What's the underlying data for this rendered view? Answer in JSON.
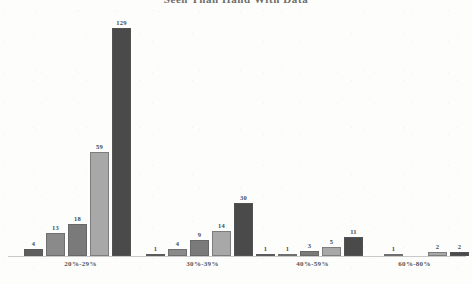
{
  "chart_data": {
    "type": "bar",
    "title": "Seen Than Hand With Data",
    "title_clipped": true,
    "categories": [
      "20%-29%",
      "30%-39%",
      "40%-59%",
      "60%-80%"
    ],
    "xlabel": "",
    "ylabel": "",
    "ylim": [
      0,
      129
    ],
    "grid": false,
    "legend": "none",
    "series": [
      {
        "name": "Series 1",
        "color": "#5e5e5e",
        "values": [
          4,
          1,
          1,
          null
        ]
      },
      {
        "name": "Series 2",
        "color": "#8a8a8a",
        "values": [
          13,
          4,
          1,
          1
        ]
      },
      {
        "name": "Series 3",
        "color": "#7a7a7a",
        "values": [
          18,
          9,
          3,
          null
        ]
      },
      {
        "name": "Series 4",
        "color": "#a8a8a8",
        "values": [
          59,
          14,
          5,
          2
        ]
      },
      {
        "name": "Series 5",
        "color": "#4a4a4a",
        "values": [
          129,
          30,
          11,
          2
        ]
      }
    ],
    "groups": [
      {
        "label": "20%-29%",
        "bars": [
          {
            "value": 4,
            "color": "#5e5e5e"
          },
          {
            "value": 13,
            "color": "#8a8a8a"
          },
          {
            "value": 18,
            "color": "#7a7a7a"
          },
          {
            "value": 59,
            "color": "#a8a8a8"
          },
          {
            "value": 129,
            "color": "#4a4a4a"
          }
        ]
      },
      {
        "label": "30%-39%",
        "bars": [
          {
            "value": 1,
            "color": "#5e5e5e"
          },
          {
            "value": 4,
            "color": "#8a8a8a"
          },
          {
            "value": 9,
            "color": "#7a7a7a"
          },
          {
            "value": 14,
            "color": "#a8a8a8"
          },
          {
            "value": 30,
            "color": "#4a4a4a"
          }
        ]
      },
      {
        "label": "40%-59%",
        "bars": [
          {
            "value": 1,
            "color": "#5e5e5e"
          },
          {
            "value": 1,
            "color": "#8a8a8a"
          },
          {
            "value": 3,
            "color": "#7a7a7a"
          },
          {
            "value": 5,
            "color": "#a8a8a8"
          },
          {
            "value": 11,
            "color": "#4a4a4a"
          }
        ]
      },
      {
        "label": "60%-80%",
        "bars": [
          {
            "value": null,
            "color": "#5e5e5e"
          },
          {
            "value": 1,
            "color": "#8a8a8a"
          },
          {
            "value": null,
            "color": "#7a7a7a"
          },
          {
            "value": 2,
            "color": "#a8a8a8"
          },
          {
            "value": 2,
            "color": "#4a4a4a"
          }
        ]
      }
    ]
  },
  "axis": {
    "baseline_color": "#c9c9c9"
  }
}
